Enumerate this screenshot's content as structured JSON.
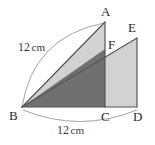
{
  "figure": {
    "background_color": "#ffffff",
    "stroke_color": "#555555",
    "light_fill": "#d2d2d2",
    "dark_fill": "#707070",
    "arc_color": "#9a9a9a",
    "text_color": "#2b2b2b"
  },
  "vertices": {
    "A": {
      "label": "A",
      "x": 105,
      "y": 22,
      "label_x": 101,
      "label_y": 16
    },
    "B": {
      "label": "B",
      "x": 22,
      "y": 107,
      "label_x": 9,
      "label_y": 120
    },
    "C": {
      "label": "C",
      "x": 105,
      "y": 107,
      "label_x": 101,
      "label_y": 121
    },
    "D": {
      "label": "D",
      "x": 137,
      "y": 107,
      "label_x": 133,
      "label_y": 121
    },
    "E": {
      "label": "E",
      "x": 137,
      "y": 38,
      "label_x": 128,
      "label_y": 32
    },
    "F": {
      "label": "F",
      "x": 105,
      "y": 49,
      "label_x": 108,
      "label_y": 49
    }
  },
  "dimensions": [
    {
      "name": "hypotenuse-BA",
      "value": "12",
      "unit": "cm",
      "label_x": 18,
      "label_y": 51,
      "arc_from_x": 22,
      "arc_from_y": 107,
      "arc_to_x": 104,
      "arc_to_y": 23,
      "arc_bulge_x": 33,
      "arc_bulge_y": 37
    },
    {
      "name": "base-BD",
      "value": "12",
      "unit": "cm",
      "label_x": 57,
      "label_y": 134,
      "arc_from_x": 23,
      "arc_from_y": 110,
      "arc_to_x": 137,
      "arc_to_y": 110,
      "arc_bulge_x": 80,
      "arc_bulge_y": 133
    }
  ],
  "regions": [
    {
      "name": "triangle-ABC",
      "fill": "light",
      "points": "22,107 105,22 105,107"
    },
    {
      "name": "triangle-BDE",
      "fill": "light",
      "points": "22,107 137,38 137,107"
    },
    {
      "name": "overlap-BCF",
      "fill": "dark",
      "points": "22,107 105,49 105,107"
    }
  ],
  "edges": [
    {
      "name": "edge-BA",
      "x1": 22,
      "y1": 107,
      "x2": 105,
      "y2": 22
    },
    {
      "name": "edge-AC",
      "x1": 105,
      "y1": 22,
      "x2": 105,
      "y2": 107
    },
    {
      "name": "edge-BD",
      "x1": 22,
      "y1": 107,
      "x2": 137,
      "y2": 107
    },
    {
      "name": "edge-BE",
      "x1": 22,
      "y1": 107,
      "x2": 137,
      "y2": 38
    },
    {
      "name": "edge-ED",
      "x1": 137,
      "y1": 38,
      "x2": 137,
      "y2": 107
    }
  ]
}
